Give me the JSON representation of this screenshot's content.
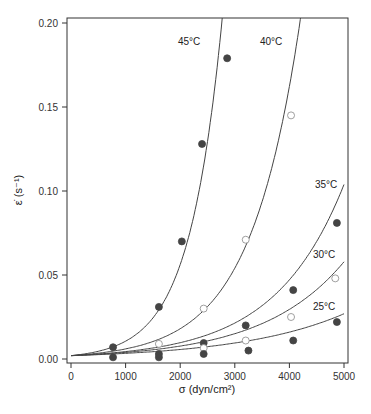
{
  "chart_data": {
    "type": "scatter",
    "title": "",
    "xlabel": "σ (dyn/cm²)",
    "ylabel": "ε̇ (s⁻¹)",
    "xlim": [
      0,
      5000
    ],
    "ylim": [
      0,
      0.2
    ],
    "xticks": [
      0,
      1000,
      2000,
      3000,
      4000,
      5000
    ],
    "xtick_labels": [
      "0",
      "1000",
      "2000",
      "3000",
      "4000",
      "5000"
    ],
    "yticks": [
      0,
      0.05,
      0.1,
      0.15,
      0.2
    ],
    "ytick_labels": [
      "0.00",
      "0.05",
      "0.10",
      "0.15",
      "0.20"
    ],
    "grid": false,
    "legend": "none",
    "series": [
      {
        "name": "45°C",
        "label": "45°C",
        "marker": "filled",
        "fit": {
          "a": 0.002,
          "k": 0.001668
        },
        "points": [
          [
            770,
            0.007
          ],
          [
            1610,
            0.031
          ],
          [
            2030,
            0.07
          ],
          [
            2400,
            0.128
          ],
          [
            2860,
            0.179
          ]
        ]
      },
      {
        "name": "40°C",
        "label": "40°C",
        "marker": "open",
        "fit": {
          "a": 0.002,
          "k": 0.001099
        },
        "points": [
          [
            1610,
            0.009
          ],
          [
            2430,
            0.03
          ],
          [
            3200,
            0.071
          ],
          [
            4030,
            0.145
          ]
        ]
      },
      {
        "name": "35°C",
        "label": "35°C",
        "marker": "filled",
        "fit": {
          "a": 0.002,
          "k": 0.00079
        },
        "points": [
          [
            770,
            0.001
          ],
          [
            2430,
            0.0095
          ],
          [
            3200,
            0.02
          ],
          [
            4070,
            0.041
          ],
          [
            4870,
            0.081
          ]
        ]
      },
      {
        "name": "30°C",
        "label": "30°C",
        "marker": "open",
        "fit": {
          "a": 0.002,
          "k": 0.000673
        },
        "points": [
          [
            2430,
            0.0065
          ],
          [
            3200,
            0.011
          ],
          [
            4030,
            0.025
          ],
          [
            4840,
            0.048
          ]
        ]
      },
      {
        "name": "25°C",
        "label": "25°C",
        "marker": "filled",
        "fit": {
          "a": 0.002,
          "k": 0.00052
        },
        "points": [
          [
            1610,
            0.001
          ],
          [
            1610,
            0.003
          ],
          [
            2430,
            0.003
          ],
          [
            3250,
            0.005
          ],
          [
            4070,
            0.011
          ],
          [
            4870,
            0.022
          ]
        ]
      }
    ]
  }
}
